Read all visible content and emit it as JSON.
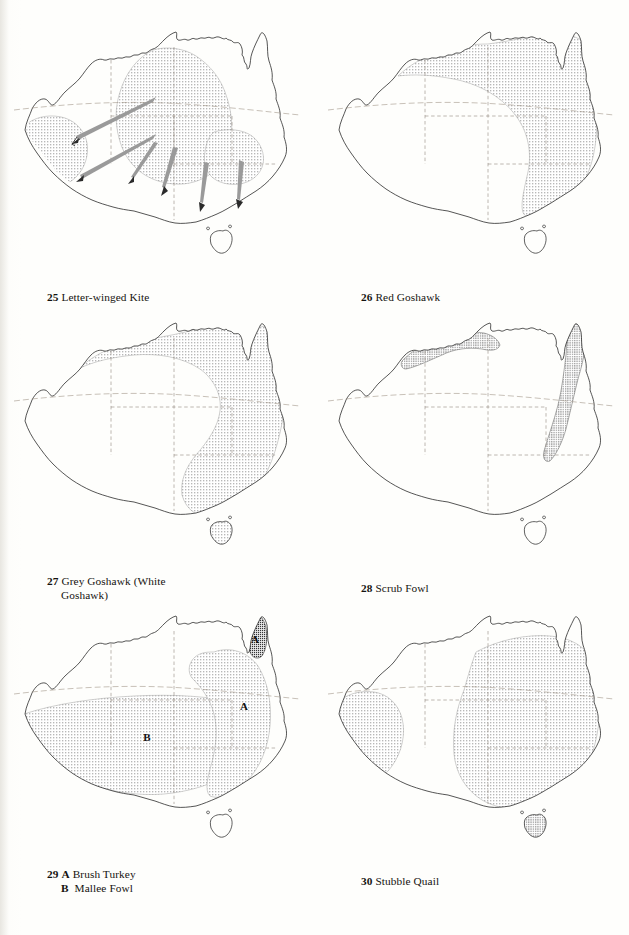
{
  "page": {
    "kind": "field-guide-distribution-map-plate",
    "background_color": "#fefefc",
    "ink_color": "#1a1a1a",
    "stipple_color": "#6e6e6e",
    "arrow_color": "#8c8c8c",
    "columns": 2,
    "rows": 3
  },
  "maps": [
    {
      "number": "25",
      "name": "Letter-winged Kite",
      "caption": "25 Letter-winged Kite",
      "caption_line2": "",
      "region": "Australia",
      "shading": "stipple",
      "distribution_note": "Core breeding range across inland central Australia plus a separate block in south-western Western Australia; irruption arrows radiate west and south.",
      "has_arrows": true,
      "arrow_count": 6,
      "region_letters": []
    },
    {
      "number": "26",
      "name": "Red Goshawk",
      "caption": "26 Red Goshawk",
      "caption_line2": "",
      "region": "Australia",
      "shading": "stipple",
      "distribution_note": "Northern and eastern Australia: Kimberley, Top End, Cape York and down the eastern seaboard to southern New South Wales.",
      "has_arrows": false,
      "arrow_count": 0,
      "region_letters": []
    },
    {
      "number": "27",
      "name": "Grey Goshawk (White Goshawk)",
      "caption": "27 Grey Goshawk (White",
      "caption_line2": "Goshawk)",
      "region": "Australia",
      "shading": "stipple",
      "distribution_note": "Coastal northern Australia and the entire eastern coastal belt south through Victoria and Tasmania.",
      "has_arrows": false,
      "arrow_count": 0,
      "region_letters": []
    },
    {
      "number": "28",
      "name": "Scrub Fowl",
      "caption": "28 Scrub Fowl",
      "caption_line2": "",
      "region": "Australia",
      "shading": "stipple",
      "distribution_note": "Narrow coastal strip of the Top End and Gulf, plus the Cape York and north-east Queensland coast.",
      "has_arrows": false,
      "arrow_count": 0,
      "region_letters": []
    },
    {
      "number": "29",
      "name": "A Brush Turkey / B Mallee Fowl",
      "caption": "29 A Brush Turkey",
      "caption_line2": "B  Mallee Fowl",
      "region": "Australia",
      "shading": "stipple",
      "distribution_note": "A = Brush Turkey, eastern Queensland and New South Wales plus Cape York. B = Mallee Fowl, southern arid and semi-arid inland.",
      "has_arrows": false,
      "arrow_count": 0,
      "region_letters": [
        "A",
        "A",
        "B"
      ]
    },
    {
      "number": "30",
      "name": "Stubble Quail",
      "caption": "30 Stubble Quail",
      "caption_line2": "",
      "region": "Australia",
      "shading": "stipple",
      "distribution_note": "Eastern and south-eastern Australia including Tasmania, with a separate south-west Western Australian population.",
      "has_arrows": false,
      "arrow_count": 0,
      "region_letters": []
    }
  ]
}
